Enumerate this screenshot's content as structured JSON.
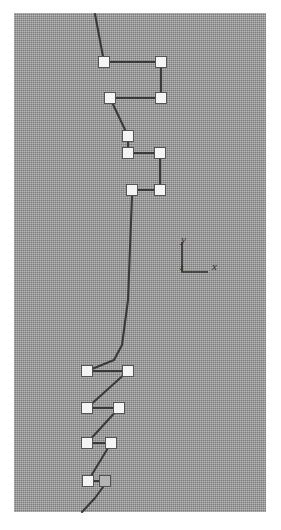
{
  "figure": {
    "canvas": {
      "width": 281,
      "height": 530,
      "background_color": "#ffffff"
    },
    "plot_area": {
      "x": 14,
      "y": 13,
      "width": 252,
      "height": 499,
      "fill_color": "#9a9a9a",
      "texture": "halftone-dither"
    },
    "style": {
      "node_fill": "#f4f4f4",
      "node_shaded_fill": "#b4b4b4",
      "node_stroke": "#4a4a4a",
      "edge_color": "#3a3a3a",
      "edge_width": 2.1,
      "node_size": 11
    }
  },
  "axis_indicator": {
    "name": "coordinate-axis-key",
    "origin_x": 182,
    "origin_y": 272,
    "arm_length_x": 26,
    "arm_length_y": 30,
    "y_label": "y",
    "y_label_x": 181,
    "y_label_y": 243,
    "x_label": "x",
    "x_label_x": 212,
    "x_label_y": 270,
    "origin_label": "z",
    "origin_label_x": 180,
    "origin_label_y": 270,
    "line_color": "#2e2e2e"
  },
  "chart_data": {
    "type": "scatter",
    "title": "",
    "xlabel": "x",
    "ylabel": "y",
    "legend": [],
    "grid": false,
    "xlim": [
      14,
      266
    ],
    "ylim": [
      13,
      512
    ],
    "nodes": [
      {
        "id": "n1",
        "x": 104,
        "y": 62,
        "fill": "white"
      },
      {
        "id": "n2",
        "x": 161,
        "y": 62,
        "fill": "white"
      },
      {
        "id": "n3",
        "x": 161,
        "y": 98,
        "fill": "white"
      },
      {
        "id": "n4",
        "x": 110,
        "y": 98,
        "fill": "white"
      },
      {
        "id": "n5",
        "x": 128,
        "y": 136,
        "fill": "white"
      },
      {
        "id": "n6",
        "x": 128,
        "y": 153,
        "fill": "white"
      },
      {
        "id": "n7",
        "x": 160,
        "y": 153,
        "fill": "white"
      },
      {
        "id": "n8",
        "x": 160,
        "y": 190,
        "fill": "white"
      },
      {
        "id": "n9",
        "x": 132,
        "y": 190,
        "fill": "white"
      },
      {
        "id": "n10",
        "x": 87,
        "y": 371,
        "fill": "white"
      },
      {
        "id": "n11",
        "x": 128,
        "y": 371,
        "fill": "white"
      },
      {
        "id": "n12",
        "x": 87,
        "y": 408,
        "fill": "white"
      },
      {
        "id": "n13",
        "x": 119,
        "y": 408,
        "fill": "white"
      },
      {
        "id": "n14",
        "x": 87,
        "y": 443,
        "fill": "white"
      },
      {
        "id": "n15",
        "x": 111,
        "y": 443,
        "fill": "white"
      },
      {
        "id": "n16",
        "x": 88,
        "y": 481,
        "fill": "white"
      },
      {
        "id": "n17",
        "x": 105,
        "y": 481,
        "fill": "shaded"
      }
    ],
    "edges": [
      {
        "from": "entry_top",
        "to": "n1"
      },
      {
        "from": "n1",
        "to": "n2"
      },
      {
        "from": "n2",
        "to": "n3"
      },
      {
        "from": "n3",
        "to": "n4"
      },
      {
        "from": "n4",
        "to": "n5"
      },
      {
        "from": "n5",
        "to": "n6"
      },
      {
        "from": "n6",
        "to": "n7"
      },
      {
        "from": "n7",
        "to": "n8"
      },
      {
        "from": "n8",
        "to": "n9"
      },
      {
        "from": "n9",
        "to": "n10"
      },
      {
        "from": "n10",
        "to": "n11"
      },
      {
        "from": "n11",
        "to": "n12"
      },
      {
        "from": "n12",
        "to": "n13"
      },
      {
        "from": "n13",
        "to": "n14"
      },
      {
        "from": "n14",
        "to": "n15"
      },
      {
        "from": "n15",
        "to": "n16"
      },
      {
        "from": "n16",
        "to": "n17"
      },
      {
        "from": "n17",
        "to": "exit_bottom"
      }
    ],
    "entry_top": {
      "x": 95,
      "y": 14
    },
    "exit_bottom": {
      "x": 82,
      "y": 512
    },
    "path_waypoints": {
      "n9_to_n10": [
        {
          "x": 132,
          "y": 196
        },
        {
          "x": 128,
          "y": 300
        },
        {
          "x": 122,
          "y": 345
        },
        {
          "x": 114,
          "y": 360
        }
      ],
      "n17_to_exit": [
        {
          "x": 103,
          "y": 487
        },
        {
          "x": 95,
          "y": 498
        },
        {
          "x": 82,
          "y": 512
        }
      ]
    }
  }
}
